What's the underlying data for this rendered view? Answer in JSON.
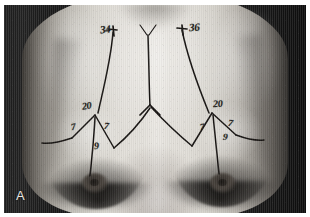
{
  "figure": {
    "panel_letter": "A",
    "type": "clinical-photograph",
    "view": "frontal-chest",
    "color_mode": "grayscale"
  },
  "colors": {
    "ink": "#171412",
    "panel_letter": "#e9e7e3",
    "backdrop": "#1a1a1a",
    "skin_highlight": "#e6e3dd",
    "plate_border": "#ffffff"
  },
  "markings": {
    "description": "Preoperative surgical planning markings drawn in ink on the chest",
    "upper": [
      {
        "id": "upper-left-sternal-notch-distance",
        "label": "34",
        "side": "left"
      },
      {
        "id": "upper-right-sternal-notch-distance",
        "label": "36",
        "side": "right"
      }
    ],
    "left_breast": [
      {
        "id": "left-vertical-limb",
        "label": "20"
      },
      {
        "id": "left-medial-limb",
        "label": "7"
      },
      {
        "id": "left-lateral-limb",
        "label": "7"
      },
      {
        "id": "left-nipple-to-fold",
        "label": "9"
      }
    ],
    "right_breast": [
      {
        "id": "right-vertical-limb",
        "label": "20"
      },
      {
        "id": "right-medial-limb",
        "label": "7"
      },
      {
        "id": "right-lateral-limb",
        "label": "7"
      },
      {
        "id": "right-nipple-to-fold",
        "label": "9"
      }
    ]
  }
}
